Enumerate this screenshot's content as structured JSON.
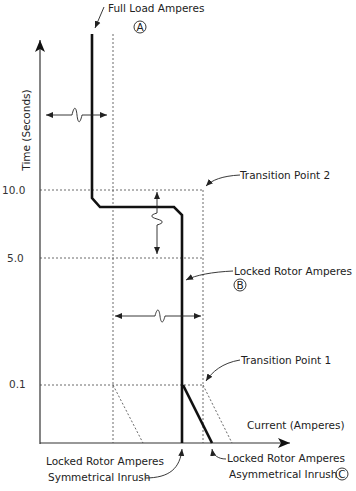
{
  "diagram": {
    "axes": {
      "y_label": "Time (Seconds)",
      "x_label": "Current (Amperes)",
      "y_ticks": [
        {
          "label": "10.0",
          "y": 190
        },
        {
          "label": "5.0",
          "y": 258
        },
        {
          "label": "0.1",
          "y": 385
        }
      ]
    },
    "annotations": {
      "full_load": "Full Load Amperes",
      "full_load_marker": "A",
      "transition_2": "Transition Point 2",
      "locked_rotor": "Locked Rotor Amperes",
      "locked_rotor_marker": "B",
      "transition_1": "Transition Point 1",
      "lra_symmetrical_line1": "Locked Rotor Amperes",
      "lra_symmetrical_line2": "Symmetrical Inrush",
      "lra_asymmetrical_line1": "Locked Rotor Amperes",
      "lra_asymmetrical_line2": "Asymmetrical Inrush",
      "lra_asymmetrical_marker": "C"
    },
    "colors": {
      "curve": "#111111",
      "grid": "#444444",
      "text": "#222222"
    }
  }
}
